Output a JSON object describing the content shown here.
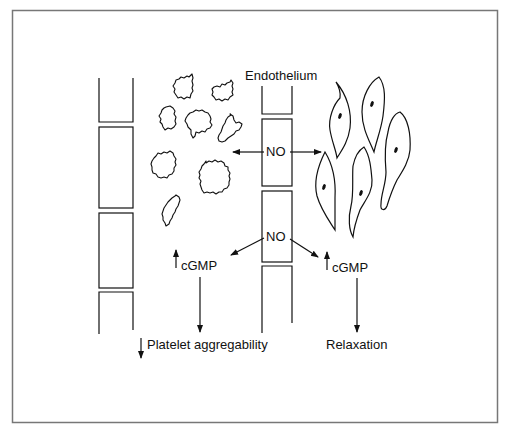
{
  "figure": {
    "frame_color": "#777777",
    "line_color": "#111111",
    "labels": {
      "endothelium": "Endothelium",
      "no_top": "NO",
      "no_bottom": "NO",
      "cgmp_left": "cGMP",
      "cgmp_right": "cGMP",
      "platelet_effect": "Platelet aggregability",
      "muscle_effect": "Relaxation"
    },
    "indicators": {
      "cgmp_left_direction": "up",
      "cgmp_right_direction": "up",
      "platelet_effect_direction": "down"
    },
    "elements": {
      "left_vessel_wall": {
        "segments": 4
      },
      "endothelium_wall": {
        "segments": 4
      },
      "platelets": {
        "count": 8
      },
      "smooth_muscle_cells": {
        "count": 5
      }
    }
  }
}
